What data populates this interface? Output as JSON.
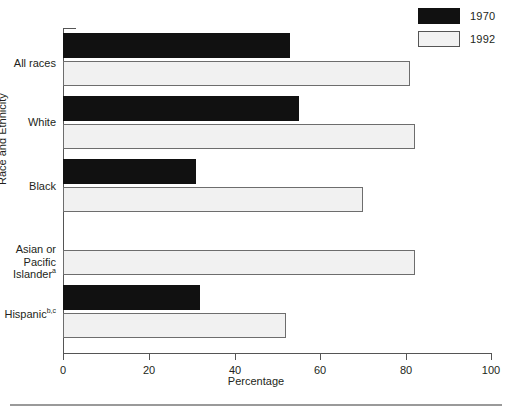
{
  "chart_data": {
    "type": "bar",
    "orientation": "horizontal",
    "title": "",
    "xlabel": "Percentage",
    "ylabel": "Race and Ethnicity",
    "xlim": [
      0,
      100
    ],
    "xticks": [
      0,
      20,
      40,
      60,
      80,
      100
    ],
    "grid": false,
    "legend_position": "top-right",
    "categories": [
      "All races",
      "White",
      "Black",
      "Asian or Pacific Islander",
      "Hispanic"
    ],
    "category_footnotes": [
      "",
      "",
      "",
      "a",
      "b,c"
    ],
    "series": [
      {
        "name": "1970",
        "color": "#111111",
        "values": [
          53,
          55,
          31,
          null,
          32
        ]
      },
      {
        "name": "1992",
        "color": "#f1f1f1",
        "values": [
          81,
          82,
          70,
          82,
          52
        ]
      }
    ]
  },
  "legend": {
    "items": [
      {
        "label": "1970",
        "swatch": "dark"
      },
      {
        "label": "1992",
        "swatch": "light"
      }
    ]
  },
  "axis": {
    "x_title": "Percentage",
    "y_title": "Race and Ethnicity",
    "x_tick_labels": [
      "0",
      "20",
      "40",
      "60",
      "80",
      "100"
    ]
  },
  "categories": [
    {
      "line1": "All races",
      "line2": "",
      "line3": "",
      "sup": ""
    },
    {
      "line1": "White",
      "line2": "",
      "line3": "",
      "sup": ""
    },
    {
      "line1": "Black",
      "line2": "",
      "line3": "",
      "sup": ""
    },
    {
      "line1": "Asian or",
      "line2": "Pacific",
      "line3": "Islander",
      "sup": "a"
    },
    {
      "line1": "Hispanic",
      "line2": "",
      "line3": "",
      "sup": "b,c"
    }
  ]
}
